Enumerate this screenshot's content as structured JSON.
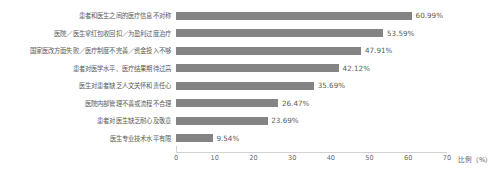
{
  "chart_data": {
    "type": "bar",
    "orientation": "horizontal",
    "title": "",
    "xlabel": "比例（%）",
    "ylabel": "",
    "xlim": [
      0,
      70
    ],
    "xticks": [
      "0",
      "10",
      "20",
      "30",
      "40",
      "50",
      "60",
      "70"
    ],
    "grid": false,
    "legend": null,
    "categories": [
      "患者和医生之间的医疗信息不对称",
      "医院／医生拿红包收回扣／为盈利过度治疗",
      "国家医改方面失败／医疗制度不完善／资金投入不够",
      "患者对医学水平、医疗结果期待过高",
      "医生对患者缺乏人文关怀和责任心",
      "医院内部管理不善或流程不合理",
      "患者对医生缺乏耐心及敬意",
      "医生专业技术水平有限"
    ],
    "values": [
      60.99,
      53.59,
      47.91,
      42.12,
      35.69,
      26.47,
      23.69,
      9.54
    ],
    "value_labels": [
      "60.99%",
      "53.59%",
      "47.91%",
      "42.12%",
      "35.69%",
      "26.47%",
      "23.69%",
      "9.54%"
    ],
    "bar_color": "#848484",
    "axis_color": "#d2d2d2",
    "text_color": "#5b5b5b",
    "background": "#ffffff"
  }
}
